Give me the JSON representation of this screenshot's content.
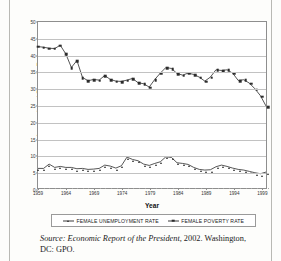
{
  "figure": {
    "ylabel": "Unemployment and Poverty Rates",
    "xlabel": "Year",
    "source_prefix": "Source:",
    "source_title": "Economic Report of the President,",
    "source_rest": " 2002. Washington, DC: GPO."
  },
  "legend": {
    "items": [
      {
        "label": "FEMALE UNEMPLOYMENT RATE",
        "marker": "triangle",
        "color": "#2b2b2b"
      },
      {
        "label": "FEMALE POVERTY RATE",
        "marker": "square",
        "color": "#2b2b2b"
      }
    ]
  },
  "chart_data": {
    "type": "line",
    "title": "",
    "xlabel": "Year",
    "ylabel": "Unemployment and Poverty Rates",
    "xlim": [
      1959,
      2000
    ],
    "ylim": [
      0,
      50
    ],
    "yticks": [
      0,
      5,
      10,
      15,
      20,
      25,
      30,
      35,
      40,
      45,
      50
    ],
    "xticks": [
      1959,
      1964,
      1969,
      1974,
      1979,
      1984,
      1989,
      1994,
      1999
    ],
    "xtick_labels": [
      "1959",
      "1964",
      "1969",
      "1974",
      "1979",
      "1984",
      "1989",
      "1994",
      "1999"
    ],
    "grid": "horizontal",
    "legend_position": "below",
    "x": [
      1959,
      1960,
      1961,
      1962,
      1963,
      1964,
      1965,
      1966,
      1967,
      1968,
      1969,
      1970,
      1971,
      1972,
      1973,
      1974,
      1975,
      1976,
      1977,
      1978,
      1979,
      1980,
      1981,
      1982,
      1983,
      1984,
      1985,
      1986,
      1987,
      1988,
      1989,
      1990,
      1991,
      1992,
      1993,
      1994,
      1995,
      1996,
      1997,
      1998,
      1999,
      2000
    ],
    "series": [
      {
        "name": "FEMALE POVERTY RATE",
        "marker": "square",
        "color": "#2b2b2b",
        "values": [
          42.6,
          42.4,
          42.1,
          42.0,
          43.0,
          40.4,
          36.3,
          38.4,
          33.3,
          32.3,
          32.7,
          32.5,
          33.9,
          32.7,
          32.2,
          32.1,
          32.5,
          33.0,
          31.7,
          31.4,
          30.4,
          32.7,
          34.6,
          36.3,
          36.0,
          34.5,
          34.0,
          34.6,
          34.2,
          33.4,
          32.2,
          33.4,
          35.6,
          35.4,
          35.6,
          34.6,
          32.4,
          32.6,
          31.6,
          29.9,
          27.8,
          24.7
        ]
      },
      {
        "name": "FEMALE UNEMPLOYMENT RATE",
        "marker": "triangle",
        "color": "#2b2b2b",
        "values": [
          5.9,
          5.9,
          7.2,
          6.2,
          6.5,
          6.2,
          6.2,
          5.8,
          5.9,
          5.6,
          5.7,
          5.9,
          6.9,
          6.6,
          6.0,
          6.7,
          9.3,
          8.6,
          8.2,
          7.2,
          6.8,
          7.4,
          7.9,
          9.4,
          9.2,
          7.6,
          7.4,
          7.1,
          6.2,
          5.6,
          5.4,
          5.5,
          6.4,
          6.9,
          6.5,
          6.0,
          5.6,
          5.4,
          5.0,
          4.6,
          4.3,
          4.8
        ]
      }
    ]
  }
}
